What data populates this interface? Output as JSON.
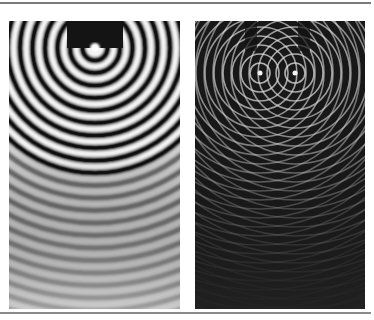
{
  "figure": {
    "panels": [
      {
        "id": "left",
        "description": "single point source ripple tank — concentric circular waves",
        "background": "#1a1a1a",
        "ring_color": "#f2f2f2",
        "source": {
          "x": 86,
          "y": 27
        }
      },
      {
        "id": "right",
        "description": "two point sources — interference pattern of circular waves",
        "background": "#151515",
        "ring_color": "#e6e6e6",
        "sources": [
          {
            "x": 65,
            "y": 52
          },
          {
            "x": 100,
            "y": 52
          }
        ]
      }
    ],
    "rule_color": "#7a7a7a"
  }
}
